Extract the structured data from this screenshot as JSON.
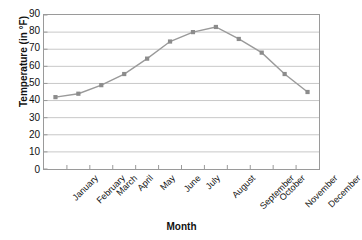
{
  "chart_data": {
    "type": "line",
    "title": "",
    "xlabel": "Month",
    "ylabel": "Temperature (in °F)",
    "categories": [
      "January",
      "February",
      "March",
      "April",
      "May",
      "June",
      "July",
      "August",
      "September",
      "October",
      "November",
      "December"
    ],
    "values": [
      42,
      44,
      49,
      55.5,
      64.5,
      74.5,
      80,
      83,
      76,
      68,
      55.5,
      45
    ],
    "series": [
      {
        "name": "Temperature",
        "values": [
          42,
          44,
          49,
          55.5,
          64.5,
          74.5,
          80,
          83,
          76,
          68,
          55.5,
          45
        ]
      }
    ],
    "ylim": [
      0,
      90
    ],
    "ytick_labels": [
      "90",
      "80",
      "70",
      "60",
      "50",
      "40",
      "30",
      "20",
      "10",
      "0"
    ],
    "ytick_values": [
      90,
      80,
      70,
      60,
      50,
      40,
      30,
      20,
      10,
      0
    ],
    "ytick_step": 10,
    "grid": "horizontal",
    "legend": "none",
    "marker": "square",
    "line_color": "#9a9a9a",
    "marker_color": "#8c8c8c",
    "grid_color": "#c8c8c8",
    "axis_color": "#9a9a9a",
    "text_color": "#111111"
  }
}
